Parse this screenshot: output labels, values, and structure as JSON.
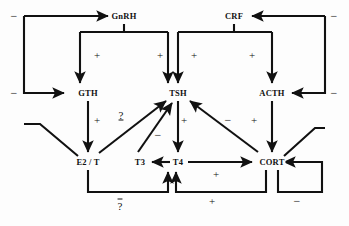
{
  "diagram": {
    "stroke_color": "#111111",
    "background_color": "#fdfdfd",
    "nodes": [
      {
        "id": "gnrh",
        "label": "GnRH",
        "x": 124,
        "y": 16
      },
      {
        "id": "crf",
        "label": "CRF",
        "x": 234,
        "y": 16
      },
      {
        "id": "gth",
        "label": "GTH",
        "x": 88,
        "y": 93
      },
      {
        "id": "tsh",
        "label": "TSH",
        "x": 178,
        "y": 93
      },
      {
        "id": "acth",
        "label": "ACTH",
        "x": 272,
        "y": 93
      },
      {
        "id": "e2t",
        "label": "E2 / T",
        "x": 88,
        "y": 162
      },
      {
        "id": "t3",
        "label": "T3",
        "x": 140,
        "y": 162
      },
      {
        "id": "t4",
        "label": "T4",
        "x": 178,
        "y": 162
      },
      {
        "id": "cort",
        "label": "CORT",
        "x": 272,
        "y": 162
      }
    ],
    "signs": [
      {
        "id": "s1",
        "text": "−",
        "x": 14,
        "y": 16,
        "kind": "minus"
      },
      {
        "id": "s2",
        "text": "−",
        "x": 14,
        "y": 93,
        "kind": "minus"
      },
      {
        "id": "s3",
        "text": "+",
        "x": 97,
        "y": 55,
        "kind": "plus"
      },
      {
        "id": "s4",
        "text": "+",
        "x": 160,
        "y": 55,
        "kind": "plus"
      },
      {
        "id": "s5",
        "text": "+",
        "x": 194,
        "y": 55,
        "kind": "plus"
      },
      {
        "id": "s6",
        "text": "+",
        "x": 252,
        "y": 55,
        "kind": "plus"
      },
      {
        "id": "s7",
        "text": "−",
        "x": 334,
        "y": 16,
        "kind": "minus"
      },
      {
        "id": "s8",
        "text": "−",
        "x": 334,
        "y": 93,
        "kind": "minus"
      },
      {
        "id": "s9",
        "text": "+",
        "x": 97,
        "y": 120,
        "kind": "plus"
      },
      {
        "id": "s10",
        "text": "+",
        "x": 184,
        "y": 120,
        "kind": "plus"
      },
      {
        "id": "s11",
        "text": "−",
        "x": 158,
        "y": 135,
        "kind": "minus"
      },
      {
        "id": "s12",
        "text": "−",
        "x": 228,
        "y": 120,
        "kind": "minus"
      },
      {
        "id": "s13",
        "text": "+",
        "x": 254,
        "y": 120,
        "kind": "plus"
      },
      {
        "id": "s14",
        "text": "+",
        "x": 216,
        "y": 174,
        "kind": "plus"
      },
      {
        "id": "s15",
        "text": "+",
        "x": 212,
        "y": 201,
        "kind": "plus"
      },
      {
        "id": "s16",
        "text": "−",
        "x": 297,
        "y": 201,
        "kind": "minus"
      }
    ],
    "question_marks": [
      {
        "id": "q_upper",
        "text": "?",
        "x": 121,
        "y": 115,
        "style": "underline"
      },
      {
        "id": "q_lower",
        "text": "?",
        "x": 120,
        "y": 206,
        "style": "overline"
      }
    ],
    "edges": [
      {
        "id": "e-gnrh-gth",
        "from": "GnRH",
        "to": "GTH",
        "sign": "+"
      },
      {
        "id": "e-gnrh-tsh",
        "from": "GnRH",
        "to": "TSH",
        "sign": "+"
      },
      {
        "id": "e-crf-tsh",
        "from": "CRF",
        "to": "TSH",
        "sign": "+"
      },
      {
        "id": "e-crf-acth",
        "from": "CRF",
        "to": "ACTH",
        "sign": "+"
      },
      {
        "id": "e-gth-e2t",
        "from": "GTH",
        "to": "E2/T",
        "sign": "+"
      },
      {
        "id": "e-tsh-t4",
        "from": "TSH",
        "to": "T4",
        "sign": "+"
      },
      {
        "id": "e-acth-cort",
        "from": "ACTH",
        "to": "CORT",
        "sign": "+"
      },
      {
        "id": "e-t4-t3",
        "from": "T4",
        "to": "T3",
        "sign": ""
      },
      {
        "id": "e-t4-cort",
        "from": "T4",
        "to": "CORT",
        "sign": "+"
      },
      {
        "id": "e-e2t-tsh",
        "from": "E2/T",
        "to": "TSH",
        "sign": "?"
      },
      {
        "id": "e-t3-tsh",
        "from": "T3",
        "to": "TSH",
        "sign": "−"
      },
      {
        "id": "e-cort-tsh",
        "from": "CORT",
        "to": "TSH",
        "sign": "−"
      },
      {
        "id": "e-e2t-gnrh",
        "from": "E2/T",
        "to": "GnRH",
        "sign": "−"
      },
      {
        "id": "e-e2t-gth",
        "from": "E2/T",
        "to": "GTH",
        "sign": "−"
      },
      {
        "id": "e-cort-crf",
        "from": "CORT",
        "to": "CRF",
        "sign": "−"
      },
      {
        "id": "e-cort-acth",
        "from": "CORT",
        "to": "ACTH",
        "sign": "−"
      },
      {
        "id": "e-cort-self",
        "from": "CORT",
        "to": "CORT",
        "sign": "−"
      },
      {
        "id": "e-e2t-t34",
        "from": "E2/T",
        "to": "T3/T4",
        "sign": "?"
      },
      {
        "id": "e-cort-t34",
        "from": "CORT",
        "to": "T3/T4",
        "sign": "+"
      }
    ]
  }
}
